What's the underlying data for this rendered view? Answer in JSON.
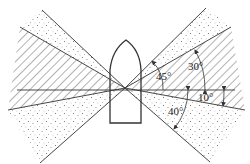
{
  "diagram": {
    "type": "navigation-light-sector-diagram",
    "labels": {
      "angle_45": "45°",
      "angle_30": "30°",
      "angle_10": "10°",
      "angle_40": "40°"
    },
    "colors": {
      "line": "#333333",
      "hatch": "#555555",
      "dots": "#666666",
      "background": "#ffffff"
    },
    "regions": [
      {
        "name": "upper-left-dotted-sector",
        "fill": "dots"
      },
      {
        "name": "left-hatched-sector",
        "fill": "hatch"
      },
      {
        "name": "lower-left-dotted-sector",
        "fill": "dots"
      },
      {
        "name": "upper-right-dotted-sector",
        "fill": "dots"
      },
      {
        "name": "right-hatched-sector",
        "fill": "hatch"
      },
      {
        "name": "lower-right-dotted-sector",
        "fill": "dots"
      }
    ],
    "vessel": "boat-outline"
  }
}
